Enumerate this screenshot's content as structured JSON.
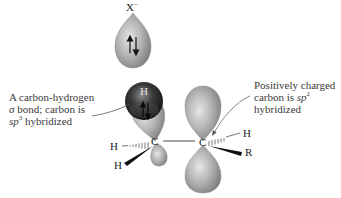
{
  "diagram": {
    "type": "orbital-diagram",
    "nucleophile": {
      "label": "X",
      "charge": "−",
      "electrons": "⇅"
    },
    "hydrogen_sphere": {
      "label": "H",
      "electrons": "⇅"
    },
    "atoms": {
      "left_carbon": "C",
      "right_carbon": "C",
      "left_h_dashed": "H",
      "left_h_wedge": "H",
      "right_h_dashed": "H",
      "right_r_wedge": "R"
    },
    "annotations": {
      "left": {
        "line1": "A carbon-hydrogen",
        "line2_sigma": "σ",
        "line2_rest": " bond; carbon is",
        "line3_sp": "sp",
        "line3_sup": "3",
        "line3_rest": " hybridized"
      },
      "right": {
        "line1": "Positively charged",
        "line2_pre": "carbon is ",
        "line2_sp": "sp",
        "line2_sup": "2",
        "line3": "hybridized"
      }
    },
    "colors": {
      "lobe_light": "#d8d8d8",
      "lobe_mid": "#a8a8a8",
      "lobe_dark": "#7a7a7a",
      "sphere_dark": "#2a2a2a",
      "text": "#3a3a3a"
    }
  }
}
